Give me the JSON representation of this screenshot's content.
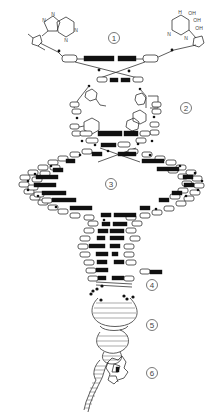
{
  "diagram": {
    "type": "dna-structure-levels",
    "stage_labels": [
      {
        "id": 1,
        "text": "1",
        "x": 114,
        "y": 38
      },
      {
        "id": 2,
        "text": "2",
        "x": 186,
        "y": 108
      },
      {
        "id": 3,
        "text": "3",
        "x": 111,
        "y": 184
      },
      {
        "id": 4,
        "text": "4",
        "x": 152,
        "y": 285
      },
      {
        "id": 5,
        "text": "5",
        "x": 152,
        "y": 325
      },
      {
        "id": 6,
        "text": "6",
        "x": 152,
        "y": 373
      }
    ],
    "molecules": {
      "left_base": {
        "name": "purine-base",
        "atoms": [
          "N",
          "N",
          "N",
          "N"
        ]
      },
      "right_base": {
        "name": "pyrimidine-base",
        "atoms": [
          "H",
          "OH",
          "OH",
          "OH",
          "N",
          "N"
        ]
      }
    },
    "colors": {
      "stroke": "#333333",
      "base_pair_fill": "#111111",
      "background": "#ffffff",
      "label_stroke": "#555555"
    }
  }
}
